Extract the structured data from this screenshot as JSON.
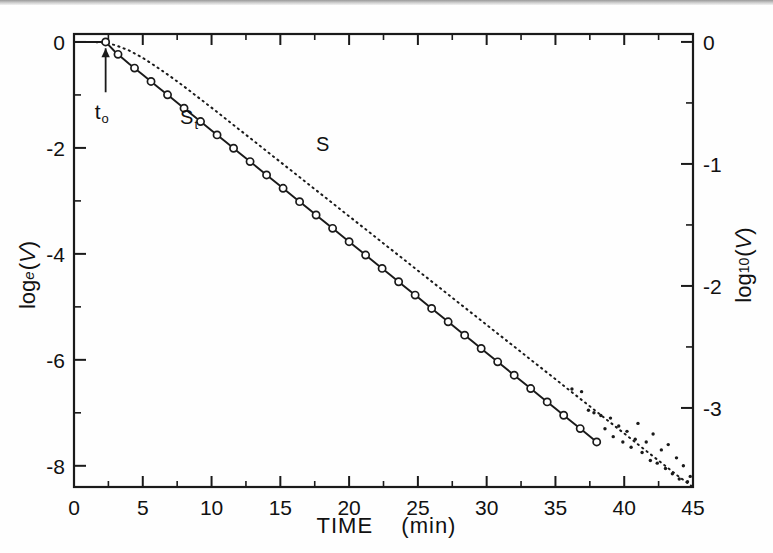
{
  "figure": {
    "background": "#fefefe",
    "frame_color": "#1a1a1a",
    "curve_color": "#1a1a1a"
  },
  "axes": {
    "x": {
      "label_main": "TIME",
      "label_unit": "(min)",
      "ticks": [
        "0",
        "5",
        "10",
        "15",
        "20",
        "25",
        "30",
        "35",
        "40",
        "45"
      ],
      "min": 0,
      "max": 45,
      "minor_per_major": 1
    },
    "y_left": {
      "label_base": "log",
      "label_sub": "e",
      "label_arg": "(V)",
      "ticks": [
        "0",
        "-2",
        "-4",
        "-6",
        "-8"
      ],
      "min": -8.4,
      "max": 0.15
    },
    "y_right": {
      "label_base": "log",
      "label_sub": "10",
      "label_arg": "(V)",
      "ticks": [
        "0",
        "-1",
        "-2",
        "-3"
      ],
      "min": -3.648,
      "max": 0.065
    }
  },
  "annotations": {
    "t0": {
      "text": "t",
      "sub": "o",
      "x": 2.3,
      "arrow": "up-arrow"
    },
    "curve_st": {
      "text": "S",
      "sub": "t",
      "x": 8.0,
      "y": -1.55
    },
    "curve_s": {
      "text": "S",
      "x": 17.6,
      "y": -2.05
    }
  },
  "chart_data": {
    "type": "line",
    "title": "",
    "xlabel": "TIME  (min)",
    "ylabel": "log_e(V)",
    "ylabel_right": "log_10(V)",
    "xlim": [
      0,
      45
    ],
    "ylim": [
      -8.4,
      0.15
    ],
    "ylim_right": [
      -3.648,
      0.065
    ],
    "grid": false,
    "legend": "inline-labels",
    "series": [
      {
        "name": "S_t",
        "style": "solid-line-with-open-circle-markers",
        "marker": "open-circle",
        "description": "Corrected survival curve; flat at 0 until t0 = 2.3 min then log-linear decay.",
        "x": [
          0.0,
          1.0,
          2.0,
          2.3,
          3.0,
          4.0,
          5.0,
          6.0,
          7.0,
          8.0,
          9.0,
          10.0,
          11.0,
          12.0,
          13.0,
          14.0,
          15.0,
          16.0,
          17.0,
          18.0,
          19.0,
          20.0,
          21.0,
          22.0,
          23.0,
          24.0,
          25.0,
          26.0,
          27.0,
          28.0,
          29.0,
          30.0,
          31.0,
          32.0,
          33.0,
          34.0,
          35.0,
          36.0,
          37.0,
          38.0
        ],
        "y": [
          0.0,
          0.0,
          0.0,
          0.0,
          -0.19,
          -0.41,
          -0.62,
          -0.83,
          -1.04,
          -1.25,
          -1.46,
          -1.67,
          -1.88,
          -2.09,
          -2.3,
          -2.51,
          -2.72,
          -2.93,
          -3.14,
          -3.35,
          -3.56,
          -3.77,
          -3.98,
          -4.19,
          -4.4,
          -4.61,
          -4.82,
          -5.03,
          -5.24,
          -5.45,
          -5.66,
          -5.87,
          -6.08,
          -6.29,
          -6.5,
          -6.71,
          -6.92,
          -7.13,
          -7.34,
          -7.55
        ],
        "marker_x": [
          2.3,
          3.2,
          4.4,
          5.6,
          6.8,
          8.0,
          9.2,
          10.4,
          11.6,
          12.8,
          14.0,
          15.2,
          16.4,
          17.6,
          18.8,
          20.0,
          21.2,
          22.4,
          23.6,
          24.8,
          26.0,
          27.2,
          28.4,
          29.6,
          30.8,
          32.0,
          33.2,
          34.4,
          35.6,
          36.8,
          38.0
        ]
      },
      {
        "name": "S",
        "style": "dotted-line",
        "marker": "fine-dots",
        "description": "Observed survival curve; lies above S_t, converges to parallel slope, noisy scattered tail beyond 38 min.",
        "x": [
          0.0,
          1.0,
          2.0,
          2.3,
          3.0,
          4.0,
          5.0,
          6.0,
          7.0,
          8.0,
          9.0,
          10.0,
          12.0,
          14.0,
          16.0,
          18.0,
          20.0,
          22.0,
          24.0,
          26.0,
          28.0,
          30.0,
          32.0,
          34.0,
          36.0,
          38.0,
          40.0,
          42.0,
          44.0,
          45.0
        ],
        "y": [
          0.0,
          0.0,
          -0.01,
          -0.02,
          -0.06,
          -0.16,
          -0.3,
          -0.47,
          -0.65,
          -0.84,
          -1.04,
          -1.24,
          -1.65,
          -2.06,
          -2.47,
          -2.88,
          -3.29,
          -3.7,
          -4.11,
          -4.52,
          -4.93,
          -5.34,
          -5.75,
          -6.16,
          -6.57,
          -6.98,
          -7.39,
          -7.8,
          -8.21,
          -8.4
        ]
      },
      {
        "name": "S-scatter-tail",
        "style": "scatter-dots",
        "description": "Noisy measurement dots about the S line from ~36 to 45 min.",
        "x": [
          36.2,
          36.9,
          37.4,
          37.8,
          38.3,
          38.6,
          39.0,
          39.2,
          39.6,
          39.9,
          40.2,
          40.5,
          40.8,
          41.0,
          41.3,
          41.6,
          41.9,
          42.1,
          42.4,
          42.7,
          43.0,
          43.2,
          43.5,
          43.8,
          44.0,
          44.3,
          44.6,
          44.8
        ],
        "y": [
          -6.55,
          -6.6,
          -6.95,
          -7.0,
          -7.05,
          -7.3,
          -7.1,
          -7.45,
          -7.25,
          -7.55,
          -7.35,
          -7.65,
          -7.5,
          -7.2,
          -7.75,
          -7.55,
          -7.9,
          -7.4,
          -7.95,
          -7.7,
          -8.05,
          -7.6,
          -8.15,
          -7.85,
          -8.25,
          -8.0,
          -8.3,
          -8.2
        ]
      }
    ]
  }
}
